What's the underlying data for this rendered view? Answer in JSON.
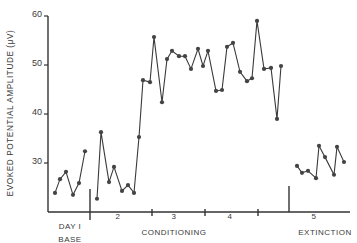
{
  "chart_data": {
    "type": "line",
    "title": "",
    "ylabel": "EVOKED POTENTIAL AMPLITUDE (μV)",
    "xlabel": "",
    "ylim": [
      19.6,
      60
    ],
    "yticks": [
      30,
      40,
      50,
      60
    ],
    "ytick_labels": [
      "30",
      "40",
      "50",
      "60"
    ],
    "grid": false,
    "legend": null,
    "line_color": "#3a3a3a",
    "marker_color": "#444444",
    "sessions": [
      {
        "label": "DAY I",
        "group": "BASE",
        "x_px": [
          55,
          60,
          66,
          73,
          79,
          85
        ],
        "values": [
          23.9,
          26.7,
          28.2,
          23.5,
          25.9,
          32.4
        ]
      },
      {
        "label": "2",
        "group": "CONDITIONING",
        "x_px": [
          97,
          101,
          109,
          114,
          122,
          128,
          134,
          139
        ],
        "values": [
          22.7,
          36.3,
          26.1,
          29.2,
          24.3,
          25.5,
          23.9,
          35.3
        ]
      },
      {
        "label": "3",
        "group": "CONDITIONING",
        "x_px": [
          143,
          150,
          154,
          162,
          167,
          172,
          179,
          185,
          191,
          198,
          203,
          208
        ],
        "values": [
          46.9,
          46.5,
          55.7,
          42.4,
          51.2,
          52.9,
          51.8,
          51.8,
          49.2,
          53.3,
          49.8,
          52.9
        ]
      },
      {
        "label": "4",
        "group": "CONDITIONING",
        "x_px": [
          216,
          222,
          227,
          233,
          240,
          247,
          252,
          257,
          264,
          271,
          277,
          281
        ],
        "values": [
          44.7,
          44.9,
          53.7,
          54.5,
          48.6,
          46.7,
          47.3,
          59.0,
          49.2,
          49.4,
          39.0,
          49.8
        ]
      },
      {
        "label": "5",
        "group": "EXTINCTION",
        "x_px": [
          297,
          302,
          308,
          316,
          319,
          325,
          334,
          337,
          344
        ],
        "values": [
          29.4,
          28.0,
          28.4,
          26.9,
          33.5,
          31.2,
          27.6,
          33.3,
          30.2
        ]
      }
    ],
    "connected_segments": [
      [
        0
      ],
      [
        1,
        2,
        3
      ],
      [
        4
      ]
    ],
    "x_labels": [
      {
        "text": "DAY I",
        "x": 70,
        "y": 229
      },
      {
        "text": "2",
        "x": 118,
        "y": 219
      },
      {
        "text": "3",
        "x": 174,
        "y": 219
      },
      {
        "text": "4",
        "x": 230,
        "y": 219
      },
      {
        "text": "5",
        "x": 314,
        "y": 219
      }
    ],
    "group_labels": [
      {
        "text": "BASE",
        "x": 70,
        "y": 242
      },
      {
        "text": "CONDITIONING",
        "x": 174,
        "y": 235
      },
      {
        "text": "EXTINCTION",
        "x": 325,
        "y": 235
      }
    ]
  }
}
